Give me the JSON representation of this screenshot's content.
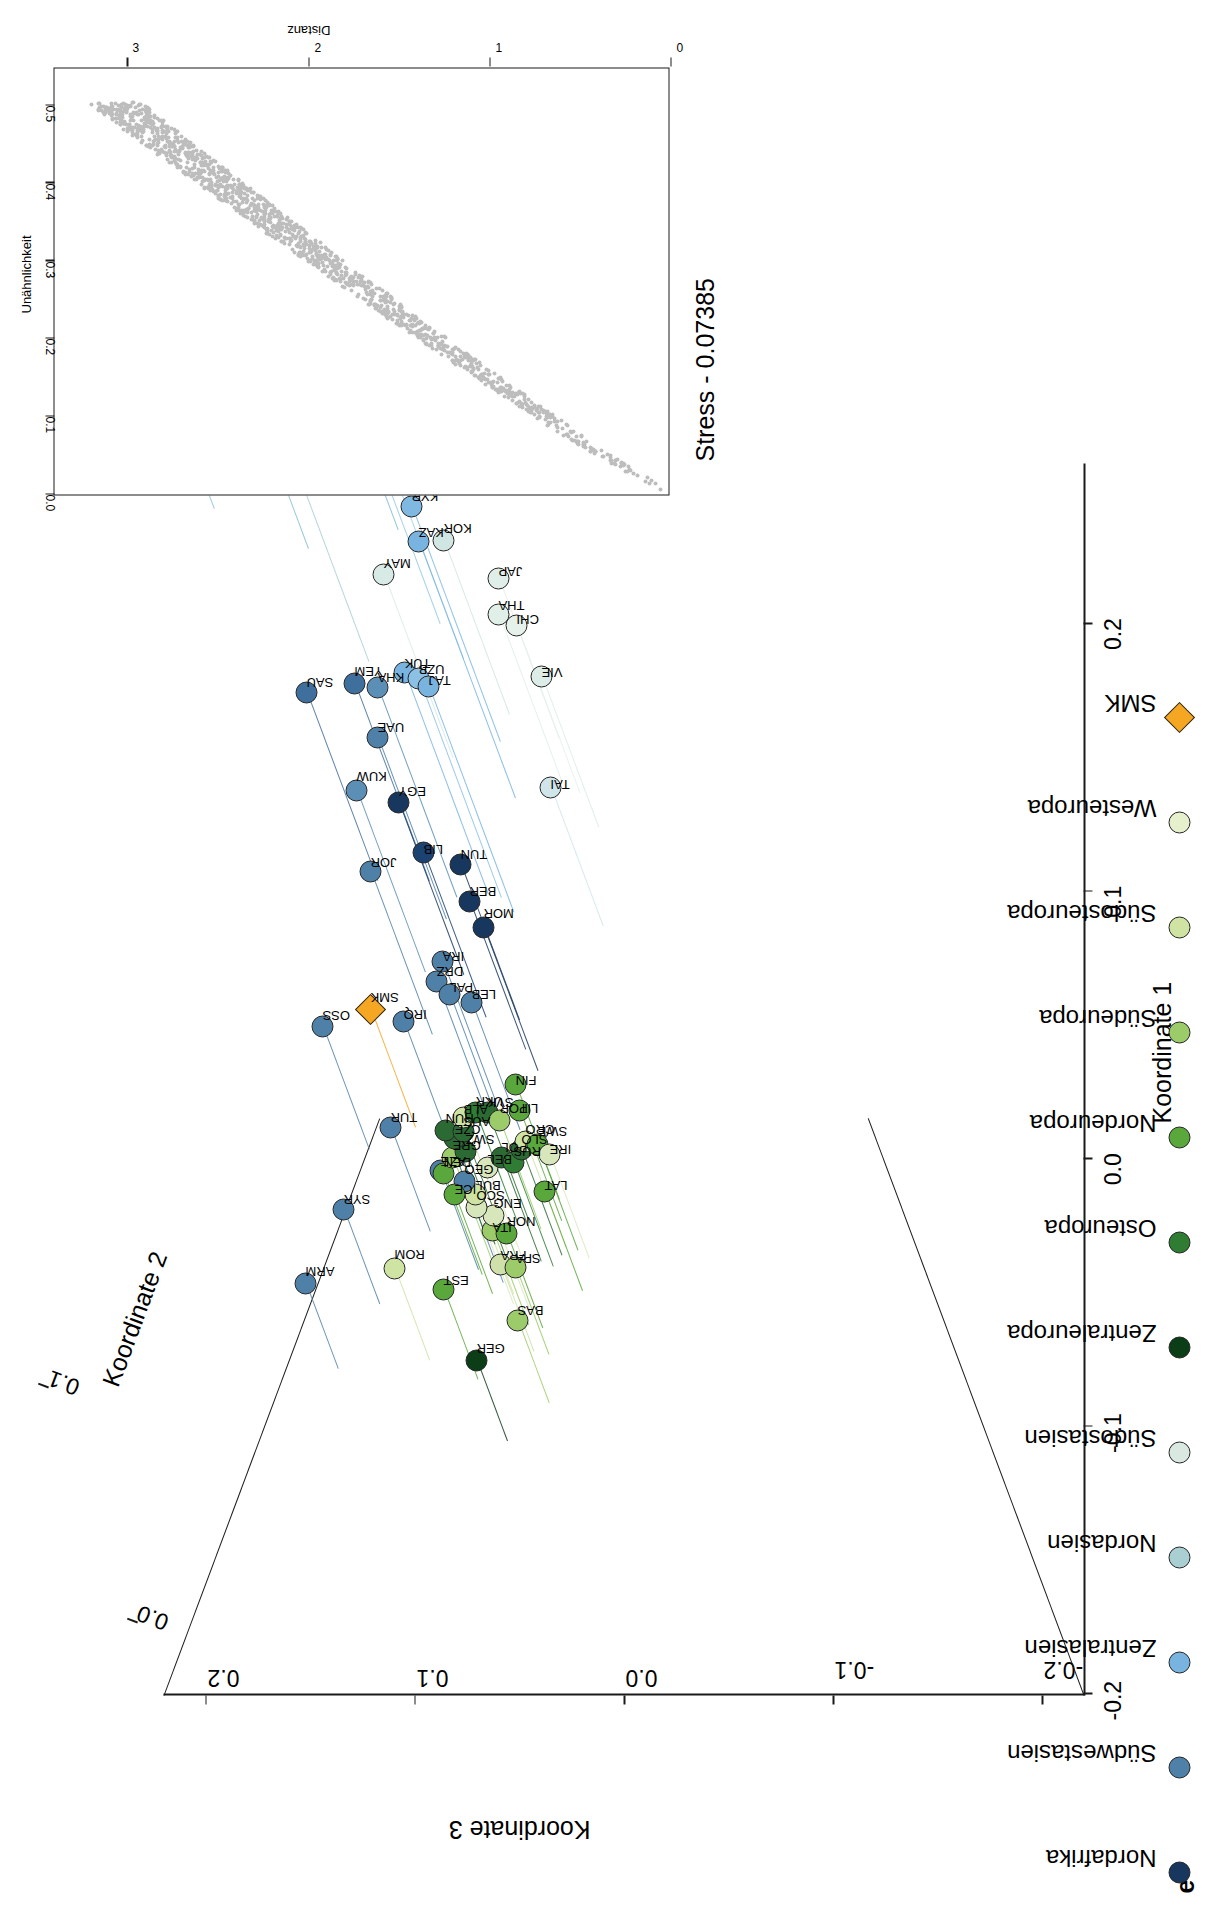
{
  "panel": {
    "letter": "e"
  },
  "axes": {
    "x_title": "Koordinate 1",
    "y_title": "Koordinate 3",
    "z_title": "Koordinate 2",
    "x_ticks": [
      "-0.2",
      "-0.1",
      "0.0",
      "0.1",
      "0.2"
    ],
    "y_ticks": [
      "-0.2",
      "-0.1",
      "0.0",
      "0.1",
      "0.2"
    ],
    "z_ticks": [
      "0.0",
      "0.1",
      "0.2"
    ]
  },
  "legend": {
    "items": [
      {
        "label": "Nordafrika",
        "color": "#17375e",
        "shape": "circle"
      },
      {
        "label": "Südwestasien",
        "color": "#4f81a8",
        "shape": "circle"
      },
      {
        "label": "Zentralasien",
        "color": "#79b4e0",
        "shape": "circle"
      },
      {
        "label": "Nordasien",
        "color": "#a9cfd3",
        "shape": "circle"
      },
      {
        "label": "Südostasien",
        "color": "#d9e9e2",
        "shape": "circle"
      },
      {
        "label": "Zentraleuropa",
        "color": "#0b3d16",
        "shape": "circle"
      },
      {
        "label": "Osteuropa",
        "color": "#2f7d32",
        "shape": "circle"
      },
      {
        "label": "Nordeuropa",
        "color": "#5aa73c",
        "shape": "circle"
      },
      {
        "label": "Südeuropa",
        "color": "#9ccb6a",
        "shape": "circle"
      },
      {
        "label": "Südosteuropa",
        "color": "#cfe3a3",
        "shape": "circle"
      },
      {
        "label": "Westeuropa",
        "color": "#e6f0cc",
        "shape": "circle"
      },
      {
        "label": "SMK",
        "color": "#f5a623",
        "shape": "diamond"
      }
    ]
  },
  "inset": {
    "stress_text": "Stress -  0.07385",
    "x_title": "Unähnlichkeit",
    "y_title": "Distanz",
    "x_ticks": [
      "0.0",
      "0.1",
      "0.2",
      "0.3",
      "0.4",
      "0.5"
    ],
    "y_ticks": [
      "0",
      "1",
      "2",
      "3"
    ],
    "x_range": [
      0.0,
      0.55
    ],
    "y_range": [
      0.0,
      3.4
    ],
    "point_color": "#bdbdbd"
  },
  "chart_data": {
    "type": "scatter",
    "title": "",
    "xlabel": "Koordinate 1",
    "ylabel": "Koordinate 3",
    "zlabel": "Koordinate 2",
    "xlim": [
      -0.2,
      0.26
    ],
    "ylim": [
      -0.22,
      0.22
    ],
    "zlim": [
      -0.03,
      0.215
    ],
    "grid": false,
    "legend_position": "bottom-left",
    "points": [
      {
        "label": "EVE",
        "x": 0.243,
        "y": 0.196,
        "z": 0.131,
        "group": "Nordasien",
        "color": "#8fc4d8"
      },
      {
        "label": "KOY",
        "x": 0.25,
        "y": 0.186,
        "z": 0.098,
        "group": "Nordasien",
        "color": "#9fcfe0"
      },
      {
        "label": "YAK",
        "x": 0.228,
        "y": 0.151,
        "z": 0.112,
        "group": "Nordasien",
        "color": "#87bfd4"
      },
      {
        "label": "TUV",
        "x": 0.235,
        "y": 0.108,
        "z": 0.105,
        "group": "Nordasien",
        "color": "#7fbcd2"
      },
      {
        "label": "BUR",
        "x": 0.186,
        "y": 0.122,
        "z": 0.075,
        "group": "Nordasien",
        "color": "#a7cfd6"
      },
      {
        "label": "ALT",
        "x": 0.2,
        "y": 0.088,
        "z": 0.081,
        "group": "Zentralasien",
        "color": "#96c9e3"
      },
      {
        "label": "MON",
        "x": 0.187,
        "y": 0.077,
        "z": 0.068,
        "group": "Zentralasien",
        "color": "#a4cfe6"
      },
      {
        "label": "KOR",
        "x": 0.166,
        "y": 0.055,
        "z": 0.044,
        "group": "Südostasien",
        "color": "#cfe6e2"
      },
      {
        "label": "JAP",
        "x": 0.157,
        "y": 0.031,
        "z": 0.038,
        "group": "Südostasien",
        "color": "#dfeee8"
      },
      {
        "label": "MAY",
        "x": 0.15,
        "y": 0.082,
        "z": 0.048,
        "group": "Südostasien",
        "color": "#d7eae5"
      },
      {
        "label": "KYR",
        "x": 0.156,
        "y": 0.059,
        "z": 0.07,
        "group": "Zentralasien",
        "color": "#7fb8e0"
      },
      {
        "label": "KAZ",
        "x": 0.135,
        "y": 0.052,
        "z": 0.079,
        "group": "Zentralasien",
        "color": "#79b4e0"
      },
      {
        "label": "THA",
        "x": 0.141,
        "y": 0.03,
        "z": 0.041,
        "group": "Südostasien",
        "color": "#e1efe9"
      },
      {
        "label": "CHI",
        "x": 0.137,
        "y": 0.021,
        "z": 0.041,
        "group": "Südostasien",
        "color": "#e6f1eb"
      },
      {
        "label": "VIE",
        "x": 0.124,
        "y": 0.012,
        "z": 0.034,
        "group": "Südostasien",
        "color": "#dcece7"
      },
      {
        "label": "TUK",
        "x": 0.099,
        "y": 0.065,
        "z": 0.064,
        "group": "Zentralasien",
        "color": "#79b4e0"
      },
      {
        "label": "UZB",
        "x": 0.098,
        "y": 0.059,
        "z": 0.063,
        "group": "Zentralasien",
        "color": "#8cc0e4"
      },
      {
        "label": "TAJ",
        "x": 0.092,
        "y": 0.053,
        "z": 0.066,
        "group": "Zentralasien",
        "color": "#79b4e0"
      },
      {
        "label": "KHA",
        "x": 0.098,
        "y": 0.08,
        "z": 0.059,
        "group": "Südwestasien",
        "color": "#5b8fb5"
      },
      {
        "label": "YEM",
        "x": 0.104,
        "y": 0.093,
        "z": 0.054,
        "group": "Südwestasien",
        "color": "#3f6f9c"
      },
      {
        "label": "SAU",
        "x": 0.104,
        "y": 0.118,
        "z": 0.05,
        "group": "Südwestasien",
        "color": "#3f6f9c"
      },
      {
        "label": "UAE",
        "x": 0.09,
        "y": 0.085,
        "z": 0.047,
        "group": "Südwestasien",
        "color": "#4f81a8"
      },
      {
        "label": "TAI",
        "x": 0.087,
        "y": 0.01,
        "z": 0.029,
        "group": "Südostasien",
        "color": "#cfe5ea"
      },
      {
        "label": "KUW",
        "x": 0.07,
        "y": 0.095,
        "z": 0.047,
        "group": "Südwestasien",
        "color": "#5b8fb5"
      },
      {
        "label": "EGY",
        "x": 0.069,
        "y": 0.077,
        "z": 0.043,
        "group": "Nordafrika",
        "color": "#17375e"
      },
      {
        "label": "LIB",
        "x": 0.053,
        "y": 0.066,
        "z": 0.04,
        "group": "Nordafrika",
        "color": "#1b4270"
      },
      {
        "label": "TUN",
        "x": 0.052,
        "y": 0.05,
        "z": 0.036,
        "group": "Nordafrika",
        "color": "#17375e"
      },
      {
        "label": "JOR",
        "x": 0.047,
        "y": 0.092,
        "z": 0.039,
        "group": "Südwestasien",
        "color": "#4f81a8"
      },
      {
        "label": "BER",
        "x": 0.041,
        "y": 0.047,
        "z": 0.033,
        "group": "Nordafrika",
        "color": "#17375e"
      },
      {
        "label": "MOR",
        "x": 0.033,
        "y": 0.041,
        "z": 0.031,
        "group": "Nordafrika",
        "color": "#17375e"
      },
      {
        "label": "IRA",
        "x": 0.023,
        "y": 0.062,
        "z": 0.028,
        "group": "Südwestasien",
        "color": "#4f81a8"
      },
      {
        "label": "DRZ",
        "x": 0.017,
        "y": 0.066,
        "z": 0.026,
        "group": "Südwestasien",
        "color": "#4f81a8"
      },
      {
        "label": "PAL",
        "x": 0.013,
        "y": 0.06,
        "z": 0.025,
        "group": "Südwestasien",
        "color": "#4f81a8"
      },
      {
        "label": "LEB",
        "x": 0.011,
        "y": 0.05,
        "z": 0.024,
        "group": "Südwestasien",
        "color": "#4f81a8"
      },
      {
        "label": "IRQ",
        "x": 0.005,
        "y": 0.083,
        "z": 0.023,
        "group": "Südwestasien",
        "color": "#4f81a8"
      },
      {
        "label": "SMK",
        "x": 0.012,
        "y": 0.1,
        "z": 0.02,
        "group": "SMK",
        "color": "#f5a623"
      },
      {
        "label": "OSS",
        "x": 0.004,
        "y": 0.122,
        "z": 0.022,
        "group": "Südwestasien",
        "color": "#4f81a8"
      },
      {
        "label": "TUR",
        "x": -0.027,
        "y": 0.093,
        "z": 0.014,
        "group": "Südwestasien",
        "color": "#4f81a8"
      },
      {
        "label": "SYR",
        "x": -0.054,
        "y": 0.117,
        "z": 0.01,
        "group": "Südwestasien",
        "color": "#4f81a8"
      },
      {
        "label": "ARM",
        "x": -0.078,
        "y": 0.137,
        "z": 0.006,
        "group": "Südwestasien",
        "color": "#4f81a8"
      },
      {
        "label": "AZE",
        "x": -0.041,
        "y": 0.07,
        "z": 0.012,
        "group": "Südwestasien",
        "color": "#4f81a8"
      },
      {
        "label": "ROM",
        "x": -0.075,
        "y": 0.093,
        "z": 0.009,
        "group": "Südosteuropa",
        "color": "#cfe3a3"
      },
      {
        "label": "EST",
        "x": -0.082,
        "y": 0.07,
        "z": 0.008,
        "group": "Nordeuropa",
        "color": "#5aa73c"
      },
      {
        "label": "GER",
        "x": -0.105,
        "y": 0.056,
        "z": 0.004,
        "group": "Zentraleuropa",
        "color": "#0b3d16"
      },
      {
        "label": "BAS",
        "x": -0.091,
        "y": 0.036,
        "z": 0.005,
        "group": "Südeuropa",
        "color": "#9ccb6a"
      },
      {
        "label": "FRA",
        "x": -0.072,
        "y": 0.043,
        "z": 0.007,
        "group": "Westeuropa",
        "color": "#cfe0ab"
      },
      {
        "label": "SPA",
        "x": -0.073,
        "y": 0.036,
        "z": 0.007,
        "group": "Südeuropa",
        "color": "#9ccb6a"
      },
      {
        "label": "ITA",
        "x": -0.062,
        "y": 0.046,
        "z": 0.01,
        "group": "Südeuropa",
        "color": "#9ccb6a"
      },
      {
        "label": "NOR",
        "x": -0.063,
        "y": 0.039,
        "z": 0.01,
        "group": "Nordeuropa",
        "color": "#5aa73c"
      },
      {
        "label": "ENG",
        "x": -0.057,
        "y": 0.045,
        "z": 0.011,
        "group": "Westeuropa",
        "color": "#d8e7bb"
      },
      {
        "label": "SCO",
        "x": -0.054,
        "y": 0.053,
        "z": 0.011,
        "group": "Westeuropa",
        "color": "#d8e7bb"
      },
      {
        "label": "BUL",
        "x": -0.05,
        "y": 0.053,
        "z": 0.012,
        "group": "Südosteuropa",
        "color": "#cfe3a3"
      },
      {
        "label": "GEO",
        "x": -0.046,
        "y": 0.058,
        "z": 0.013,
        "group": "Südwestasien",
        "color": "#4f81a8"
      },
      {
        "label": "ICE",
        "x": -0.05,
        "y": 0.063,
        "z": 0.012,
        "group": "Nordeuropa",
        "color": "#5aa73c"
      },
      {
        "label": "DEN",
        "x": -0.043,
        "y": 0.068,
        "z": 0.013,
        "group": "Nordeuropa",
        "color": "#5aa73c"
      },
      {
        "label": "GRE",
        "x": -0.038,
        "y": 0.063,
        "z": 0.014,
        "group": "Südeuropa",
        "color": "#9ccb6a"
      },
      {
        "label": "SWZ",
        "x": -0.036,
        "y": 0.057,
        "z": 0.014,
        "group": "Zentraleuropa",
        "color": "#2b6b33"
      },
      {
        "label": "CZE",
        "x": -0.032,
        "y": 0.062,
        "z": 0.015,
        "group": "Zentraleuropa",
        "color": "#2b6b33"
      },
      {
        "label": "HUN",
        "x": -0.029,
        "y": 0.066,
        "z": 0.015,
        "group": "Zentraleuropa",
        "color": "#2b6b33"
      },
      {
        "label": "AUS",
        "x": -0.03,
        "y": 0.057,
        "z": 0.016,
        "group": "Zentraleuropa",
        "color": "#2b6b33"
      },
      {
        "label": "ALB",
        "x": -0.025,
        "y": 0.057,
        "z": 0.016,
        "group": "Südosteuropa",
        "color": "#cfe3a3"
      },
      {
        "label": "UKR",
        "x": -0.024,
        "y": 0.051,
        "z": 0.017,
        "group": "Osteuropa",
        "color": "#2f7d32"
      },
      {
        "label": "SVK",
        "x": -0.024,
        "y": 0.045,
        "z": 0.017,
        "group": "Zentraleuropa",
        "color": "#2b6b33"
      },
      {
        "label": "POR",
        "x": -0.026,
        "y": 0.04,
        "z": 0.016,
        "group": "Südeuropa",
        "color": "#9ccb6a"
      },
      {
        "label": "LIT",
        "x": -0.023,
        "y": 0.03,
        "z": 0.017,
        "group": "Nordeuropa",
        "color": "#5aa73c"
      },
      {
        "label": "BEL",
        "x": -0.041,
        "y": 0.047,
        "z": 0.013,
        "group": "Westeuropa",
        "color": "#d8e7bb"
      },
      {
        "label": "POL",
        "x": -0.038,
        "y": 0.04,
        "z": 0.014,
        "group": "Zentraleuropa",
        "color": "#2b6b33"
      },
      {
        "label": "RUS",
        "x": -0.04,
        "y": 0.034,
        "z": 0.014,
        "group": "Osteuropa",
        "color": "#2f7d32"
      },
      {
        "label": "SLO",
        "x": -0.036,
        "y": 0.03,
        "z": 0.015,
        "group": "Zentraleuropa",
        "color": "#2b6b33"
      },
      {
        "label": "CRO",
        "x": -0.033,
        "y": 0.028,
        "z": 0.015,
        "group": "Südosteuropa",
        "color": "#cfe3a3"
      },
      {
        "label": "SWE",
        "x": -0.034,
        "y": 0.022,
        "z": 0.015,
        "group": "Nordeuropa",
        "color": "#5aa73c"
      },
      {
        "label": "IRE",
        "x": -0.037,
        "y": 0.017,
        "z": 0.014,
        "group": "Westeuropa",
        "color": "#d8e7bb"
      },
      {
        "label": "LAT",
        "x": -0.049,
        "y": 0.02,
        "z": 0.012,
        "group": "Nordeuropa",
        "color": "#5aa73c"
      },
      {
        "label": "FIN",
        "x": -0.015,
        "y": 0.031,
        "z": 0.019,
        "group": "Nordeuropa",
        "color": "#5aa73c"
      }
    ]
  }
}
